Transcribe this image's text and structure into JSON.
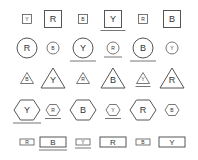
{
  "grid": {
    "stroke": "#555555",
    "underline_color": "#666666",
    "columns_x": [
      27,
      53,
      83,
      113,
      143,
      172
    ],
    "rows": [
      {
        "shape": "square",
        "y": 19,
        "items": [
          {
            "letter": "Y",
            "size": "small",
            "underlined": false
          },
          {
            "letter": "R",
            "size": "large",
            "underlined": false
          },
          {
            "letter": "B",
            "size": "small",
            "underlined": false
          },
          {
            "letter": "Y",
            "size": "large",
            "underlined": true
          },
          {
            "letter": "R",
            "size": "small",
            "underlined": false
          },
          {
            "letter": "B",
            "size": "large",
            "underlined": false
          }
        ]
      },
      {
        "shape": "circle",
        "y": 48,
        "items": [
          {
            "letter": "R",
            "size": "large",
            "underlined": false
          },
          {
            "letter": "B",
            "size": "small",
            "underlined": false
          },
          {
            "letter": "Y",
            "size": "large",
            "underlined": true
          },
          {
            "letter": "R",
            "size": "small",
            "underlined": true
          },
          {
            "letter": "B",
            "size": "large",
            "underlined": true
          },
          {
            "letter": "Y",
            "size": "small",
            "underlined": false
          }
        ]
      },
      {
        "shape": "triangle",
        "y": 78,
        "items": [
          {
            "letter": "B",
            "size": "small",
            "underlined": false
          },
          {
            "letter": "Y",
            "size": "large",
            "underlined": false
          },
          {
            "letter": "R",
            "size": "small",
            "underlined": false
          },
          {
            "letter": "B",
            "size": "large",
            "underlined": false
          },
          {
            "letter": "Y",
            "size": "small",
            "underlined": true
          },
          {
            "letter": "R",
            "size": "large",
            "underlined": false
          }
        ]
      },
      {
        "shape": "hexagon",
        "y": 110,
        "items": [
          {
            "letter": "Y",
            "size": "large",
            "underlined": true
          },
          {
            "letter": "R",
            "size": "small",
            "underlined": true
          },
          {
            "letter": "B",
            "size": "large",
            "underlined": false
          },
          {
            "letter": "Y",
            "size": "small",
            "underlined": true
          },
          {
            "letter": "R",
            "size": "large",
            "underlined": false
          },
          {
            "letter": "B",
            "size": "small",
            "underlined": false
          }
        ]
      },
      {
        "shape": "rectangle",
        "y": 142,
        "items": [
          {
            "letter": "R",
            "size": "small",
            "underlined": false
          },
          {
            "letter": "B",
            "size": "large",
            "underlined": true
          },
          {
            "letter": "Y",
            "size": "small",
            "underlined": true
          },
          {
            "letter": "R",
            "size": "large",
            "underlined": false
          },
          {
            "letter": "B",
            "size": "small",
            "underlined": false
          },
          {
            "letter": "Y",
            "size": "large",
            "underlined": false
          }
        ]
      }
    ]
  }
}
